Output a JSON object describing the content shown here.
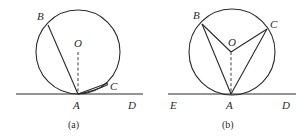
{
  "figures": [
    {
      "id": "a",
      "caption": "(a)",
      "labels": {
        "B": "B",
        "O": "O",
        "C": "C",
        "A": "A",
        "D": "D"
      },
      "description": "Circle with centre O tangent to line AD at A; chord AB, chord AC with arc, dashed radius OA"
    },
    {
      "id": "b",
      "caption": "(b)",
      "labels": {
        "B": "B",
        "O": "O",
        "C": "C",
        "A": "A",
        "D": "D",
        "E": "E"
      },
      "description": "Circle with centre O tangent to line ED at A; chords AB and AC, radii OB and OC, dashed radius OA"
    }
  ]
}
